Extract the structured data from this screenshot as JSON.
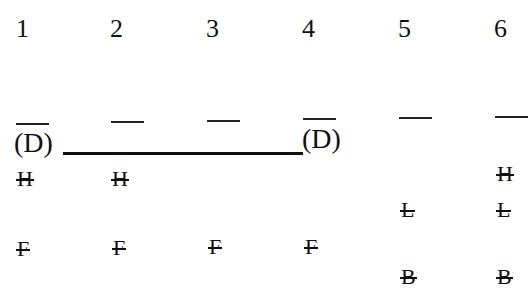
{
  "columns": [
    {
      "number": "1",
      "label": "(D)",
      "letters": [
        "H",
        "F"
      ]
    },
    {
      "number": "2",
      "label": "",
      "letters": [
        "H",
        "F"
      ]
    },
    {
      "number": "3",
      "label": "",
      "letters": [
        "F"
      ]
    },
    {
      "number": "4",
      "label": "(D)",
      "letters": [
        "F"
      ]
    },
    {
      "number": "5",
      "label": "",
      "letters": [
        "L",
        "B"
      ]
    },
    {
      "number": "6",
      "label": "",
      "letters": [
        "H",
        "L",
        "B"
      ]
    }
  ],
  "connector": {
    "from_column": "1",
    "to_column": "4"
  }
}
